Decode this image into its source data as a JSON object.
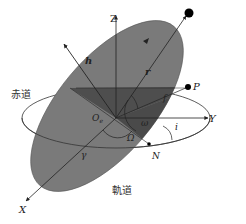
{
  "diagram": {
    "labels": {
      "z_axis": "Z",
      "x_axis": "X",
      "y_axis": "Y",
      "angular_momentum": "h",
      "radius_vector": "r",
      "equator": "赤道",
      "orbit": "軌道",
      "origin": "O",
      "origin_sub": "e",
      "true_anomaly": "f",
      "arg_perigee": "ω",
      "raan": "Ω",
      "inclination": "i",
      "ascending_node": "N",
      "perigee": "P",
      "vernal_equinox": "γ"
    },
    "colors": {
      "orbit_plane": "#7a7a7a",
      "orbit_plane_dark": "#555555",
      "orbit_plane_darker": "#4a4a4a",
      "lines": "#222222",
      "equator_line": "#333333",
      "background": "#ffffff"
    }
  }
}
